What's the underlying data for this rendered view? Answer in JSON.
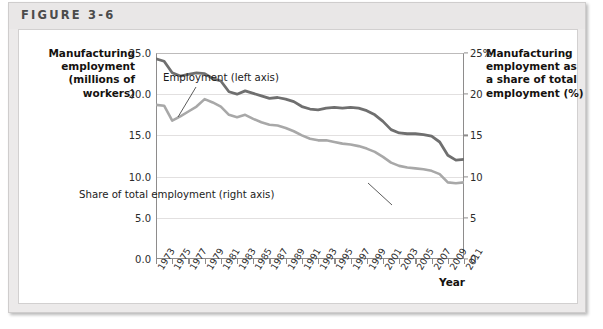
{
  "figure": {
    "label": "FIGURE 3-6"
  },
  "axes": {
    "left_title": "Manufacturing employment (millions of workers)",
    "left_title_lines": [
      "Manufacturing",
      "employment",
      "(millions of",
      "workers)"
    ],
    "right_title": "Manufacturing employment as a share of total employment (%)",
    "right_title_lines": [
      "Manufacturing",
      "employment as",
      "a share of total",
      "employment (%)"
    ],
    "x_title": "Year",
    "left_ticks": [
      "0.0",
      "5.0",
      "10.0",
      "15.0",
      "20.0",
      "25.0"
    ],
    "right_ticks": [
      "0",
      "5",
      "10",
      "15",
      "20",
      "25%"
    ]
  },
  "annotations": {
    "employment": "Employment (left axis)",
    "share": "Share of total employment (right axis)"
  },
  "colors": {
    "employment_line": "#6f6f6f",
    "share_line": "#a8a8a8",
    "axis": "#8e8c8c",
    "grid": "#e2e0e0",
    "frame": "#eceaea",
    "panel": "#ffffff",
    "text": "#15120f"
  },
  "chart_data": {
    "type": "line",
    "title": "",
    "xlabel": "Year",
    "ylabel": "Manufacturing employment (millions of workers)",
    "y2label": "Manufacturing employment as a share of total employment (%)",
    "ylim": [
      0,
      25
    ],
    "y2lim": [
      0,
      25
    ],
    "xlim": [
      1973,
      2011
    ],
    "grid": true,
    "legend": "inline-annotations",
    "x": [
      1973,
      1974,
      1975,
      1976,
      1977,
      1978,
      1979,
      1980,
      1981,
      1982,
      1983,
      1984,
      1985,
      1986,
      1987,
      1988,
      1989,
      1990,
      1991,
      1992,
      1993,
      1994,
      1995,
      1996,
      1997,
      1998,
      1999,
      2000,
      2001,
      2002,
      2003,
      2004,
      2005,
      2006,
      2007,
      2008,
      2009,
      2010,
      2011
    ],
    "tick_labels": [
      "1973",
      "1975",
      "1977",
      "1979",
      "1981",
      "1983",
      "1985",
      "1987",
      "1989",
      "1991",
      "1993",
      "1995",
      "1997",
      "1999",
      "2001",
      "2003",
      "2005",
      "2007",
      "2009",
      "2011"
    ],
    "series": [
      {
        "name": "Employment (left axis)",
        "axis": "left",
        "units": "millions of workers",
        "color": "#6f6f6f",
        "values": [
          24.3,
          24.0,
          22.6,
          22.2,
          22.4,
          22.6,
          22.5,
          21.9,
          21.6,
          20.3,
          20.0,
          20.4,
          20.1,
          19.8,
          19.5,
          19.6,
          19.4,
          19.1,
          18.5,
          18.2,
          18.1,
          18.3,
          18.4,
          18.3,
          18.4,
          18.3,
          18.0,
          17.5,
          16.7,
          15.7,
          15.3,
          15.2,
          15.2,
          15.1,
          14.9,
          14.2,
          12.6,
          12.0,
          12.1
        ]
      },
      {
        "name": "Share of total employment (right axis)",
        "axis": "right",
        "units": "%",
        "color": "#a8a8a8",
        "values": [
          18.7,
          18.6,
          16.8,
          17.3,
          17.9,
          18.5,
          19.4,
          19.0,
          18.5,
          17.5,
          17.2,
          17.5,
          17.0,
          16.6,
          16.3,
          16.2,
          15.9,
          15.5,
          15.0,
          14.6,
          14.4,
          14.4,
          14.2,
          14.0,
          13.9,
          13.7,
          13.4,
          13.0,
          12.4,
          11.7,
          11.3,
          11.1,
          11.0,
          10.9,
          10.7,
          10.3,
          9.3,
          9.2,
          9.3
        ]
      }
    ],
    "note_employment_scale": "dark line plotted on left axis (millions)",
    "note_share_scale": "light line plotted on right axis (percent)"
  }
}
